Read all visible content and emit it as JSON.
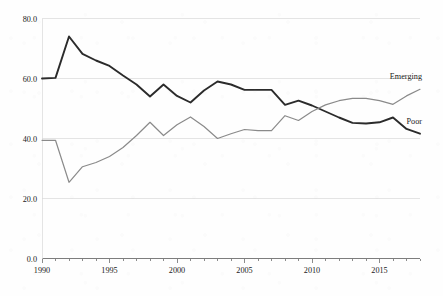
{
  "chart_data": {
    "type": "line",
    "title": "",
    "subtitle": "",
    "xlabel": "",
    "ylabel": "",
    "xlim": [
      1990,
      2018
    ],
    "ylim": [
      0,
      80
    ],
    "grid": true,
    "legend_position": "inline-right-end-labels",
    "x": [
      1990,
      1991,
      1992,
      1993,
      1994,
      1995,
      1996,
      1997,
      1998,
      1999,
      2000,
      2001,
      2002,
      2003,
      2004,
      2005,
      2006,
      2007,
      2008,
      2009,
      2010,
      2011,
      2012,
      2013,
      2014,
      2015,
      2016,
      2017,
      2018
    ],
    "x_tick_labels": [
      "1990",
      "1995",
      "2000",
      "2005",
      "2010",
      "2015"
    ],
    "x_tick_values": [
      1990,
      1995,
      2000,
      2005,
      2010,
      2015
    ],
    "x_minor_ticks_every": 1,
    "y_tick_labels": [
      "0.0",
      "20.0",
      "40.0",
      "60.0",
      "80.0"
    ],
    "y_tick_values": [
      0,
      20,
      40,
      60,
      80
    ],
    "series": [
      {
        "name": "Poor",
        "label": "Poor",
        "color": "#2b2b2b",
        "width": 1.9,
        "values": [
          60.0,
          60.2,
          74.0,
          68.2,
          66.0,
          64.2,
          61.0,
          58.0,
          54.0,
          58.0,
          54.2,
          52.0,
          56.0,
          59.0,
          58.0,
          56.2,
          56.2,
          56.2,
          51.2,
          52.6,
          51.0,
          49.0,
          47.0,
          45.2,
          45.0,
          45.4,
          47.0,
          43.2,
          41.6
        ]
      },
      {
        "name": "Emerging",
        "label": "Emerging",
        "color": "#8a8a8a",
        "width": 1.2,
        "values": [
          39.4,
          39.4,
          25.4,
          30.6,
          32.0,
          34.0,
          37.0,
          41.0,
          45.4,
          41.0,
          44.6,
          47.2,
          44.0,
          40.0,
          41.6,
          43.0,
          42.6,
          42.6,
          47.6,
          46.0,
          49.0,
          51.2,
          52.6,
          53.4,
          53.4,
          52.6,
          51.4,
          54.2,
          56.4
        ]
      }
    ]
  }
}
